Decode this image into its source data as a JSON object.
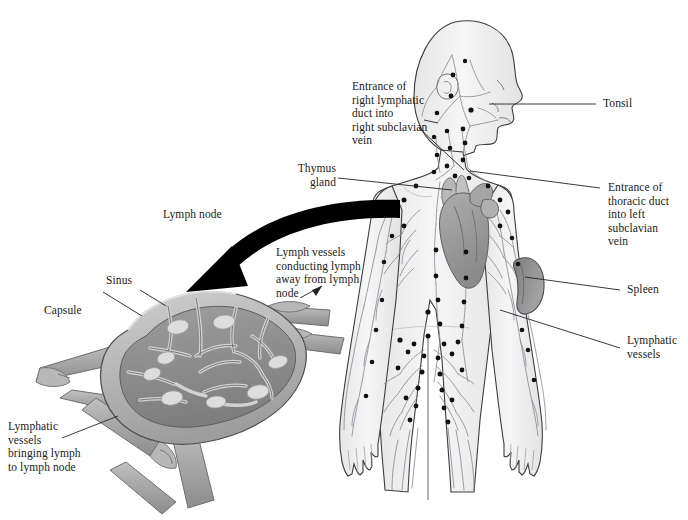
{
  "figure": {
    "background_color": "#ffffff",
    "width": 688,
    "height": 520
  },
  "palette": {
    "body_fill": "#f2f2f2",
    "body_outline": "#3d3d3d",
    "vessel_line": "#8d8d96",
    "node_dot": "#111111",
    "heart_fill": "#9a9a9a",
    "heart_dark": "#828282",
    "thymus_fill": "#b4b4b4",
    "spleen_fill": "#8e8e8e",
    "lymphnode_capsule": "#b9b9b9",
    "lymphnode_cortex": "#8f8f8f",
    "lymphnode_follicle": "#d8d8d8",
    "vessel_tube": "#a8a8a8",
    "arrow_black": "#000000",
    "leader_line": "#222222",
    "text": "#1a1a1a"
  },
  "labels": {
    "right_lymphatic_duct": "Entrance of\nright lymphatic\nduct into\nright subclavian\nvein",
    "tonsil": "Tonsil",
    "thymus_gland": "Thymus\ngland",
    "thoracic_duct": "Entrance of\nthoracic duct\ninto left\nsubclavian\nvein",
    "spleen": "Spleen",
    "lymphatic_vessels": "Lymphatic\nvessels",
    "lymph_node": "Lymph node",
    "sinus": "Sinus",
    "capsule": "Capsule",
    "efferent_vessels": "Lymph vessels\nconducting lymph\naway from lymph\nnode",
    "afferent_vessels": "Lymphatic\nvessels\nbringing lymph\nto lymph node"
  },
  "structures": {
    "body": [
      "head",
      "neck",
      "torso",
      "arms",
      "legs",
      "hands"
    ],
    "organs": [
      "tonsil",
      "thymus",
      "heart",
      "spleen"
    ],
    "node_detail": [
      "capsule",
      "sinus",
      "cortex",
      "follicles",
      "afferent-vessels",
      "efferent-vessels",
      "valves"
    ]
  }
}
